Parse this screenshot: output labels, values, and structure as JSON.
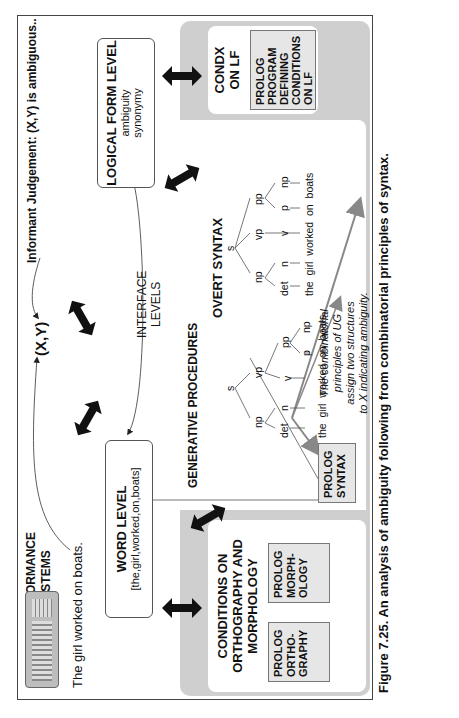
{
  "figure": {
    "orientation": "rotated 90 degrees counterclockwise",
    "caption": "Figure 7.25.  An analysis of ambiguity following from combinatorial principles of syntax."
  },
  "performance": {
    "title_line1": "PERFORMANCE",
    "title_line2": "SYSTEMS",
    "sentence": "The girl worked on boats.",
    "keyboard_icon": "keyboard-icon",
    "xy_label": "(X,Y)",
    "judgement": "Informant Judgement: (X,Y) is ambiguous.."
  },
  "interface": {
    "label_line1": "INTERFACE",
    "label_line2": "LEVELS"
  },
  "word_level": {
    "title": "WORD LEVEL",
    "content": "[the,girl,worked,on,boats]"
  },
  "logical_form_level": {
    "title": "LOGICAL FORM LEVEL",
    "line1": "ambiguity",
    "line2": "synonymy"
  },
  "generative": {
    "title": "GENERATIVE PROCEDURES"
  },
  "ortho_panel": {
    "title_line1": "CONDITIONS ON",
    "title_line2": "ORTHOGRAPHY AND",
    "title_line3": "MORPHOLOGY",
    "box1": [
      "PROLOG",
      "ORTHO-",
      "GRAPHY"
    ],
    "box2": [
      "PROLOG",
      "MORPH-",
      "OLOGY"
    ]
  },
  "syntax_panel": {
    "title": "OVERT SYNTAX",
    "prolog_box": [
      "PROLOG",
      "SYNTAX"
    ],
    "note_lines": [
      "The combinatorial",
      "principles of UG",
      "assign two structures",
      "to X indicating ambiguity."
    ],
    "tree1": {
      "description": "PP attached to VP",
      "nodes": {
        "s": "s",
        "np": "np",
        "vp": "vp",
        "det": "det",
        "n": "n",
        "v": "v",
        "pp": "pp",
        "p": "p",
        "np2": "np"
      },
      "words": [
        "the",
        "girl",
        "worked",
        "on",
        "boats"
      ]
    },
    "tree2": {
      "description": "PP as sister of V under S-level VP",
      "nodes": {
        "s": "s",
        "np": "np",
        "vp": "vp",
        "det": "det",
        "n": "n",
        "v": "v",
        "pp": "pp",
        "p": "p",
        "np2": "np"
      },
      "words": [
        "the",
        "girl",
        "worked",
        "on",
        "boats"
      ]
    }
  },
  "condx_panel": {
    "title_line1": "CONDX",
    "title_line2": "ON LF",
    "box": [
      "PROLOG",
      "PROGRAM",
      "DEFINING",
      "CONDITIONS",
      "ON LF"
    ]
  },
  "colors": {
    "gray_band": "#cfcfcf",
    "prolog_fill": "#e6e6e6",
    "arrow": "#111111",
    "ug_arrow": "#888888",
    "border": "#444444"
  }
}
